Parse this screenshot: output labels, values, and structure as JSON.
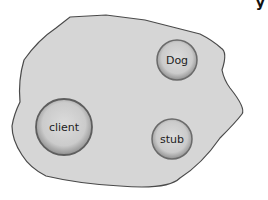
{
  "diagram": {
    "type": "object-space",
    "region": {
      "fill": "#d6d6d6",
      "stroke": "#4a4a4a"
    },
    "nodes": [
      {
        "id": "dog",
        "label": "Dog",
        "cx": 177,
        "cy": 60,
        "r": 20
      },
      {
        "id": "client",
        "label": "client",
        "cx": 64,
        "cy": 127,
        "r": 28
      },
      {
        "id": "stub",
        "label": "stub",
        "cx": 172,
        "cy": 139,
        "r": 20
      }
    ],
    "node_style": {
      "fill": "#cfcfcf",
      "stroke": "#6a6a6a"
    },
    "corner_glyph": "y"
  }
}
